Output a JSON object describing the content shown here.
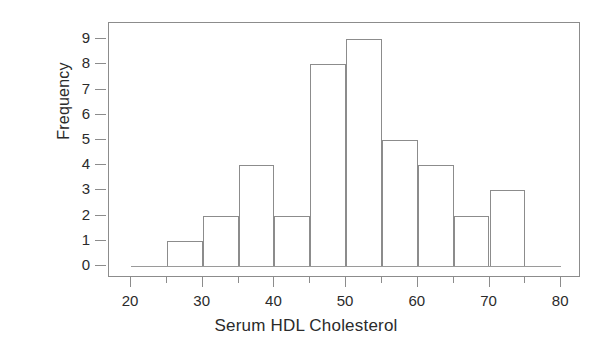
{
  "chart_data": {
    "type": "bar",
    "title": "",
    "xlabel": "Serum HDL Cholesterol",
    "ylabel": "Frequency",
    "bin_width": 5,
    "bin_starts": [
      25,
      30,
      35,
      40,
      45,
      50,
      55,
      60,
      65,
      70
    ],
    "bin_ends": [
      30,
      35,
      40,
      45,
      50,
      55,
      60,
      65,
      70,
      75
    ],
    "categories": [
      "25-30",
      "30-35",
      "35-40",
      "40-45",
      "45-50",
      "50-55",
      "55-60",
      "60-65",
      "65-70",
      "70-75"
    ],
    "values": [
      1,
      2,
      4,
      2,
      8,
      9,
      5,
      4,
      2,
      3
    ],
    "xlim": [
      20,
      80
    ],
    "ylim": [
      0,
      9
    ],
    "xticks": [
      20,
      25,
      30,
      35,
      40,
      45,
      50,
      55,
      60,
      65,
      70,
      75,
      80
    ],
    "xtick_labels": [
      "20",
      "",
      "30",
      "",
      "40",
      "",
      "50",
      "",
      "60",
      "",
      "70",
      "",
      "80"
    ],
    "xtick_major": [
      20,
      30,
      40,
      50,
      60,
      70,
      80
    ],
    "yticks": [
      0,
      1,
      2,
      3,
      4,
      5,
      6,
      7,
      8,
      9
    ],
    "ytick_labels": [
      "0",
      "1",
      "2",
      "3",
      "4",
      "5",
      "6",
      "7",
      "8",
      "9"
    ],
    "grid": false,
    "legend": null,
    "line_color": "#8c8c8c",
    "text_color": "#2b2b2b",
    "background": "#ffffff"
  },
  "axes": {
    "x_title": "Serum HDL Cholesterol",
    "y_title": "Frequency"
  }
}
